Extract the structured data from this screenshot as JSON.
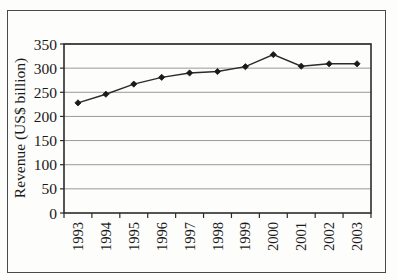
{
  "chart_data": {
    "type": "line",
    "title": "",
    "subtitle": "",
    "xlabel": "",
    "ylabel": "Revenue (US$ billion)",
    "categories": [
      "1993",
      "1994",
      "1995",
      "1996",
      "1997",
      "1998",
      "1999",
      "2000",
      "2001",
      "2002",
      "2003"
    ],
    "values": [
      228,
      246,
      267,
      281,
      290,
      293,
      303,
      328,
      304,
      309,
      309
    ],
    "series": [
      {
        "name": "Revenue",
        "values": [
          228,
          246,
          267,
          281,
          290,
          293,
          303,
          328,
          304,
          309,
          309
        ]
      }
    ],
    "ylim": [
      0,
      350
    ],
    "yticks": [
      0,
      50,
      100,
      150,
      200,
      250,
      300,
      350
    ],
    "ytick_labels": [
      "0",
      "50",
      "100",
      "150",
      "200",
      "250",
      "300",
      "350"
    ],
    "xtick_labels": [
      "1993",
      "1994",
      "1995",
      "1996",
      "1997",
      "1998",
      "1999",
      "2000",
      "2001",
      "2002",
      "2003"
    ],
    "grid": "horizontal",
    "legend": "none",
    "marker": "diamond",
    "line_color": "#2b2b2b",
    "marker_color": "#1a1a1a",
    "grid_color": "#9a9a9a",
    "axis_color": "#2b2b2b",
    "background_color": "#fdfdfb",
    "xtick_rotation": 90,
    "annotations": []
  },
  "axes": {
    "y_axis_title": "Revenue (US$ billion)"
  }
}
